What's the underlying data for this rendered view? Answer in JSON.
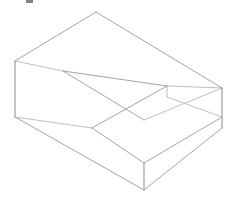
{
  "canvas": {
    "width": 232,
    "height": 199,
    "background_color": "#ffffff",
    "title": "Isometric Stepped Block Wireframe"
  },
  "style": {
    "line_color": "#9a9a9a",
    "line_color_faint": "#b4b4b4",
    "line_color_strong": "#8c8c8c",
    "face_fill": "#ffffff",
    "line_width": 0.9
  },
  "artifact": {
    "name": "top-edge-crop-mark",
    "x": 26,
    "y": 0,
    "width": 7,
    "height": 3,
    "color": "#6e6e6e"
  },
  "geometry": {
    "description": "Isometric wireframe of a rectangular block with a rectangular step notch cut from the front-right lower portion.",
    "projection": "isometric",
    "vertices": {
      "top_back_apex": [
        96,
        12
      ],
      "top_left": [
        15,
        61
      ],
      "top_right": [
        222,
        88
      ],
      "top_front": [
        144,
        136
      ],
      "top_mid_left": [
        63,
        71
      ],
      "top_mid_right": [
        167,
        86
      ],
      "bottom_left": [
        15,
        117
      ],
      "bottom_front": [
        144,
        190
      ],
      "bottom_right": [
        222,
        128
      ],
      "notch_top": [
        167,
        86
      ],
      "notch_left": [
        92,
        128
      ],
      "notch_right": [
        222,
        117
      ],
      "notch_front": [
        144,
        163
      ],
      "ledge_left": [
        92,
        128
      ],
      "ledge_front": [
        144,
        163
      ]
    },
    "edges": [
      {
        "name": "top-face-back-left",
        "from": "top_back_apex",
        "to": "top_left"
      },
      {
        "name": "top-face-back-right",
        "from": "top_back_apex",
        "to": "top_right"
      },
      {
        "name": "top-face-ridge-left",
        "from": "top_left",
        "to": "top_mid_left"
      },
      {
        "name": "top-face-ridge-diagonal",
        "from": "top_mid_left",
        "to": "top_mid_right"
      },
      {
        "name": "top-face-ridge-right",
        "from": "top_mid_right",
        "to": "top_right"
      },
      {
        "name": "left-vertical-edge",
        "from": "top_left",
        "to": "bottom_left"
      },
      {
        "name": "right-vertical-edge",
        "from": "top_right",
        "to": "bottom_right"
      },
      {
        "name": "front-vertical-edge",
        "from": "notch_front",
        "to": "bottom_front"
      },
      {
        "name": "bottom-front-left",
        "from": "bottom_left",
        "to": "bottom_front"
      },
      {
        "name": "bottom-front-right",
        "from": "bottom_front",
        "to": "bottom_right"
      },
      {
        "name": "step-ledge-left",
        "from": "ledge_left",
        "to": "notch_front"
      },
      {
        "name": "step-ledge-right",
        "from": "notch_front",
        "to": "notch_right"
      },
      {
        "name": "step-back-left",
        "from": "ledge_left",
        "to": "notch_top"
      },
      {
        "name": "step-back-right",
        "from": "notch_top",
        "to": "notch_right"
      },
      {
        "name": "step-inner-vertical",
        "from": "notch_top",
        "to": "top_mid_right"
      },
      {
        "name": "mid-crossing-left",
        "from": "top_mid_left",
        "to": "ledge_left"
      }
    ],
    "faces": [
      {
        "name": "top-face",
        "points": "96,12 222,88 167,86 63,71 15,61"
      },
      {
        "name": "left-side-face",
        "points": "15,61 63,71 92,128 144,163 144,190 15,117"
      },
      {
        "name": "right-side-face",
        "points": "222,88 222,128 144,190 144,163 222,117"
      },
      {
        "name": "step-ledge-face",
        "points": "92,128 167,86 222,117 144,163"
      }
    ]
  },
  "labels": {
    "shape_name": "stepped-rectangular-block",
    "visible_text": ""
  }
}
